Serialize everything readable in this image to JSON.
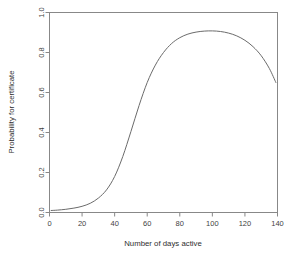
{
  "chart_data": {
    "type": "line",
    "title": "",
    "xlabel": "Number of days active",
    "ylabel": "Probability for certificate",
    "xlim": [
      0,
      140
    ],
    "ylim": [
      0.0,
      1.0
    ],
    "grid": false,
    "legend": false,
    "xticks": [
      0,
      20,
      40,
      60,
      80,
      100,
      120,
      140
    ],
    "xtick_labels": [
      "0",
      "20",
      "40",
      "60",
      "80",
      "100",
      "120",
      "140"
    ],
    "yticks": [
      0.0,
      0.2,
      0.4,
      0.6,
      0.8,
      1.0
    ],
    "ytick_labels": [
      "0.0",
      "0.2",
      "0.4",
      "0.6",
      "0.8",
      "1.0"
    ],
    "series": [
      {
        "name": "Probability for certificate",
        "color": "#6b6b6b",
        "x": [
          1,
          5,
          10,
          15,
          20,
          25,
          30,
          35,
          40,
          45,
          50,
          55,
          60,
          65,
          70,
          75,
          80,
          85,
          90,
          95,
          100,
          105,
          110,
          115,
          120,
          125,
          130,
          135,
          139
        ],
        "y": [
          0.01,
          0.012,
          0.016,
          0.022,
          0.031,
          0.046,
          0.072,
          0.113,
          0.18,
          0.28,
          0.405,
          0.535,
          0.65,
          0.737,
          0.8,
          0.845,
          0.874,
          0.892,
          0.902,
          0.907,
          0.908,
          0.905,
          0.897,
          0.883,
          0.861,
          0.829,
          0.784,
          0.72,
          0.65
        ]
      }
    ],
    "annotations": []
  },
  "axes": {
    "x_axis_name": "x-axis",
    "y_axis_name": "y-axis"
  }
}
